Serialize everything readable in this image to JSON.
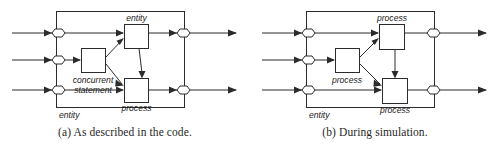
{
  "figure": {
    "kind": "two-panel-block-diagram",
    "panels": [
      {
        "id": "a",
        "caption": "(a) As described in the code.",
        "outer_label": "entity",
        "blocks": [
          {
            "id": "top-right",
            "label": "entity"
          },
          {
            "id": "middle-left",
            "label": "concurrent statement",
            "label_line1": "concurrent",
            "label_line2": "statement"
          },
          {
            "id": "bottom-right",
            "label": "process"
          }
        ],
        "ports": {
          "inputs": 3,
          "outputs": 2,
          "symbol": "hexagon-port"
        }
      },
      {
        "id": "b",
        "caption": "(b) During simulation.",
        "outer_label": "entity",
        "blocks": [
          {
            "id": "top-right",
            "label": "process"
          },
          {
            "id": "middle-left",
            "label": "process"
          },
          {
            "id": "bottom-right",
            "label": "process"
          }
        ],
        "ports": {
          "inputs": 3,
          "outputs": 2,
          "symbol": "hexagon-port"
        }
      }
    ]
  },
  "colors": {
    "ink": "#2b2b2b",
    "text": "#1a1a1a",
    "paper": "#ffffff"
  }
}
